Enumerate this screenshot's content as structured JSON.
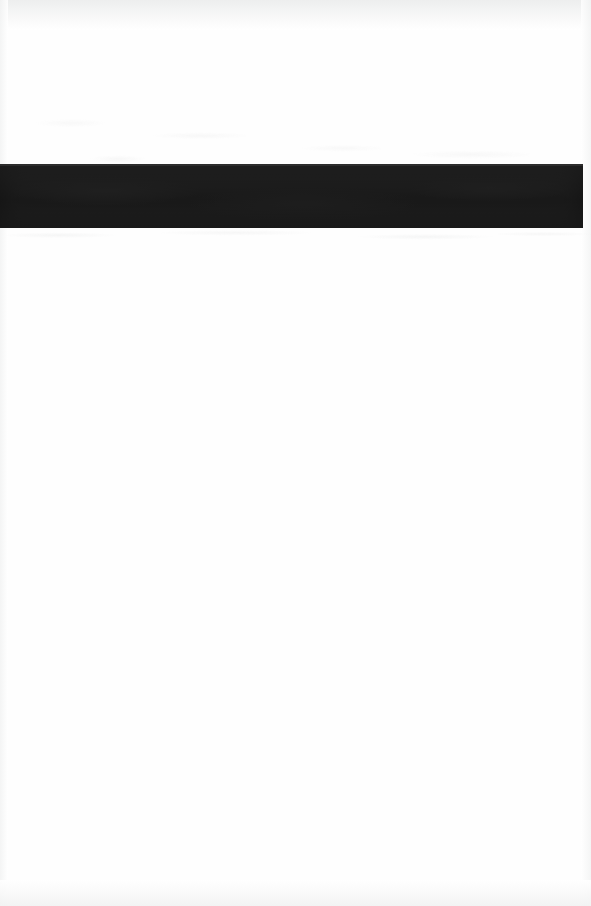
{
  "document": {
    "page_kind": "scanned-page",
    "page_width": 591,
    "page_height": 906,
    "background_color": "#ffffff",
    "paper_color": "#fefefe",
    "visible_text": "",
    "header_text": "",
    "footer_text": "",
    "page_number": "",
    "body_text": ""
  },
  "redaction": {
    "label": "",
    "color": "#1c1c1c",
    "x": 0,
    "y": 164,
    "width": 583,
    "height": 64
  },
  "scan_artifacts": {
    "top_edge_color": "#eceded",
    "bottom_edge_color": "#f1f2f2",
    "side_edge_color": "#f2f3f3",
    "noise_color": "#f1f1f1"
  },
  "regions": {
    "upper_blank_label": "",
    "lower_blank_label": ""
  }
}
